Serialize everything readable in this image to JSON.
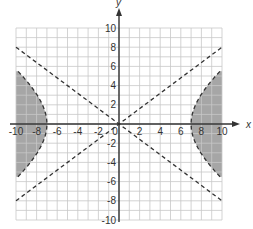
{
  "chart_data": {
    "type": "line",
    "title": "",
    "xlabel": "x",
    "ylabel": "y",
    "xlim": [
      -10,
      10
    ],
    "ylim": [
      -10,
      10
    ],
    "grid": true,
    "x_ticks": [
      -10,
      -8,
      -6,
      -4,
      -2,
      0,
      2,
      4,
      6,
      8,
      10
    ],
    "x_tick_labels": [
      "-10",
      "-8",
      "-6",
      "-4",
      "-2",
      "0",
      "2",
      "4",
      "6",
      "8",
      "10"
    ],
    "y_ticks": [
      -10,
      -8,
      -6,
      -4,
      -2,
      2,
      4,
      6,
      8,
      10
    ],
    "y_tick_labels": [
      "-10",
      "-8",
      "-6",
      "-4",
      "-2",
      "2",
      "4",
      "6",
      "8",
      "10"
    ],
    "series": [
      {
        "name": "asymptote-1",
        "style": "dashed",
        "x": [
          -10,
          10
        ],
        "y": [
          -8,
          8
        ]
      },
      {
        "name": "asymptote-2",
        "style": "dashed",
        "x": [
          -10,
          10
        ],
        "y": [
          8,
          -8
        ]
      },
      {
        "name": "hyperbola",
        "style": "dashed",
        "equation": "x^2/49 - y^2/31.36 = 1",
        "vertices": [
          [
            -7,
            0
          ],
          [
            7,
            0
          ]
        ],
        "y_at_x_edge": [
          5.7,
          -5.7
        ]
      }
    ],
    "shaded_regions": [
      {
        "description": "outside left branch of hyperbola",
        "x_range": [
          -10,
          -7
        ],
        "color": "#a6a6a6"
      },
      {
        "description": "outside right branch of hyperbola",
        "x_range": [
          7,
          10
        ],
        "color": "#a6a6a6"
      }
    ],
    "colors": {
      "grid": "#c8c8c8",
      "axis": "#333333",
      "shade": "#a6a6a6",
      "dash": "#333333"
    }
  }
}
